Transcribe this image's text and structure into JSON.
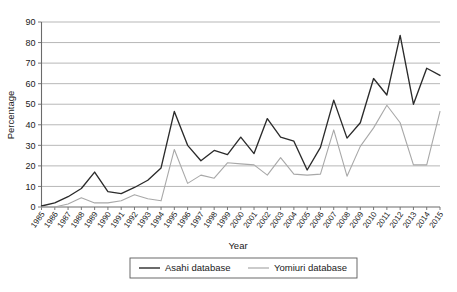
{
  "chart_data": {
    "type": "line",
    "title": "",
    "xlabel": "Year",
    "ylabel": "Percentage",
    "ylim": [
      0,
      90
    ],
    "yticks": [
      0,
      10,
      20,
      30,
      40,
      50,
      60,
      70,
      80,
      90
    ],
    "grid": true,
    "legend_position": "bottom",
    "categories": [
      "1985",
      "1986",
      "1987",
      "1988",
      "1989",
      "1990",
      "1991",
      "1992",
      "1993",
      "1994",
      "1995",
      "1996",
      "1997",
      "1998",
      "1999",
      "2000",
      "2001",
      "2002",
      "2003",
      "2004",
      "2005",
      "2006",
      "2007",
      "2008",
      "2009",
      "2010",
      "2011",
      "2012",
      "2013",
      "2014",
      "2015"
    ],
    "series": [
      {
        "name": "Asahi database",
        "color": "#2b2b2b",
        "values": [
          0.5,
          2,
          5,
          9,
          17,
          7.5,
          6.5,
          9.5,
          13,
          19,
          46.5,
          30,
          22.5,
          27.5,
          25.5,
          34,
          26,
          43,
          34,
          32,
          18,
          29,
          52,
          33.5,
          41,
          62.5,
          54.5,
          83.5,
          50,
          67.5,
          64
        ]
      },
      {
        "name": "Yomiuri database",
        "color": "#a8a8a8",
        "values": [
          0,
          0,
          1.5,
          4.5,
          2,
          2,
          3,
          6,
          4,
          3,
          28,
          11.5,
          15.5,
          14,
          21.5,
          21,
          20.5,
          15.5,
          24,
          16,
          15.5,
          16,
          37.5,
          15,
          29.5,
          38.5,
          49.5,
          41,
          20.5,
          20.5,
          46.5
        ]
      }
    ]
  },
  "legend": {
    "entries": [
      {
        "label": "Asahi database"
      },
      {
        "label": "Yomiuri database"
      }
    ]
  }
}
